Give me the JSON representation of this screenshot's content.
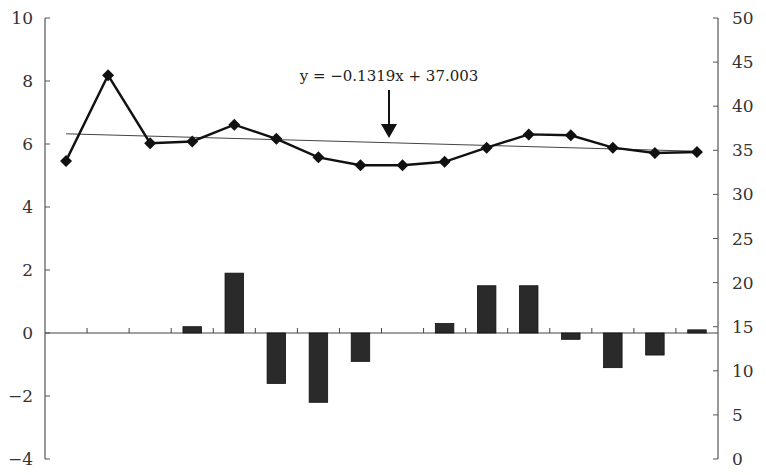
{
  "chart_data": {
    "type": "bar+line",
    "title": "",
    "xlabel": "",
    "categories": [
      "1",
      "2",
      "3",
      "4",
      "5",
      "6",
      "7",
      "8",
      "9",
      "10",
      "11",
      "12",
      "13",
      "14",
      "15",
      "16"
    ],
    "left_axis": {
      "ylabel": "",
      "ylim": [
        -4,
        10
      ],
      "ticks": [
        10,
        8,
        6,
        4,
        2,
        0,
        -2,
        -4
      ],
      "tick_labels": [
        "10",
        "8",
        "6",
        "4",
        "2",
        "0",
        "−2",
        "−4"
      ]
    },
    "right_axis": {
      "ylabel": "",
      "ylim": [
        0,
        50
      ],
      "ticks": [
        50,
        45,
        40,
        35,
        30,
        25,
        20,
        15,
        10,
        5,
        0
      ],
      "tick_labels": [
        "50",
        "45",
        "40",
        "35",
        "30",
        "25",
        "20",
        "15",
        "10",
        "5",
        "0"
      ]
    },
    "series": [
      {
        "name": "bars",
        "type": "bar",
        "axis": "left",
        "color": "#2a2a2a",
        "values": [
          0,
          0,
          0,
          0.2,
          1.9,
          -1.6,
          -2.2,
          -0.9,
          0,
          0.3,
          1.5,
          1.5,
          -0.2,
          -1.1,
          -0.7,
          0.1
        ]
      },
      {
        "name": "line",
        "type": "line",
        "axis": "right",
        "marker": "diamond",
        "color": "#111111",
        "values": [
          33.8,
          43.5,
          35.8,
          36.0,
          37.9,
          36.3,
          34.2,
          33.3,
          33.3,
          33.7,
          35.3,
          36.8,
          36.7,
          35.3,
          34.7,
          34.8
        ]
      },
      {
        "name": "trendline",
        "type": "line",
        "axis": "right",
        "color": "#444444",
        "equation": "y = −0.1319x + 37.003",
        "slope": -0.1319,
        "intercept": 37.003
      }
    ],
    "annotations": [
      {
        "text": "y = −0.1319x + 37.003",
        "arrow": "down",
        "points_to": "trendline"
      }
    ],
    "grid": false,
    "legend": null
  }
}
